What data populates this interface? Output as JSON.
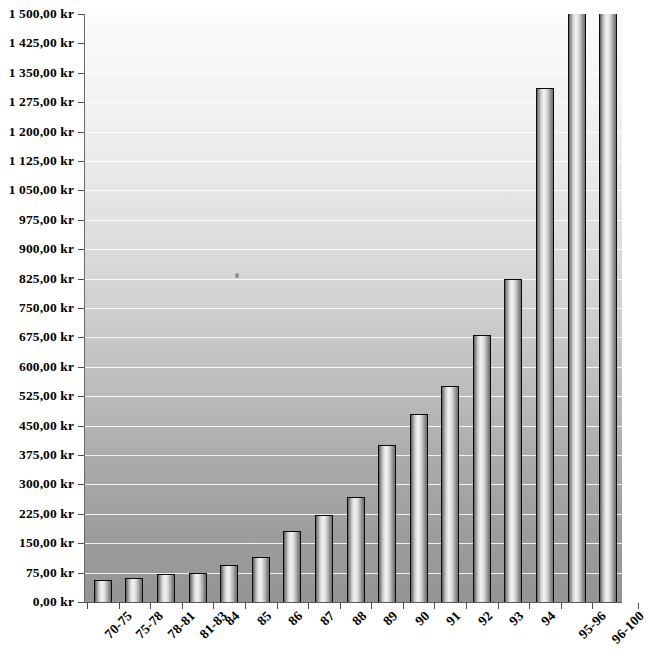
{
  "chart_data": {
    "type": "bar",
    "title": "",
    "subtitle": "",
    "xlabel": "",
    "ylabel": "",
    "categories": [
      "70-75",
      "75-78",
      "78-81",
      "81-83",
      "84",
      "85",
      "86",
      "87",
      "88",
      "89",
      "90",
      "91",
      "92",
      "93",
      "94",
      "95-96",
      "96-100"
    ],
    "values": [
      57,
      60,
      72,
      75,
      95,
      115,
      180,
      222,
      268,
      400,
      480,
      550,
      682,
      825,
      1310,
      1620,
      1610
    ],
    "value_suffix": " kr",
    "ylim": [
      0,
      1500
    ],
    "ytick_step": 75,
    "ytick_labels": [
      "1 500,00 kr",
      "1 425,00 kr",
      "1 350,00 kr",
      "1 275,00 kr",
      "1 200,00 kr",
      "1 125,00 kr",
      "1 050,00 kr",
      "975,00 kr",
      "900,00 kr",
      "825,00 kr",
      "750,00 kr",
      "675,00 kr",
      "600,00 kr",
      "525,00 kr",
      "450,00 kr",
      "375,00 kr",
      "300,00 kr",
      "225,00 kr",
      "150,00 kr",
      "75,00 kr",
      "0,00 kr"
    ],
    "ytick_values": [
      1500,
      1425,
      1350,
      1275,
      1200,
      1125,
      1050,
      975,
      900,
      825,
      750,
      675,
      600,
      525,
      450,
      375,
      300,
      225,
      150,
      75,
      0
    ],
    "grid": true,
    "grid_axis": "y",
    "legend": false,
    "legend_position": "none",
    "colors": {
      "bar_fill_light": "#f2f2f2",
      "bar_fill_dark": "#5c5c5c",
      "bar_outline": "#0b0b0b",
      "plot_bg_top": "#fbfbfb",
      "plot_bg_bottom": "#949494",
      "gridline": "#ffffff",
      "axis": "#5a5a5a",
      "text": "#000000"
    }
  }
}
